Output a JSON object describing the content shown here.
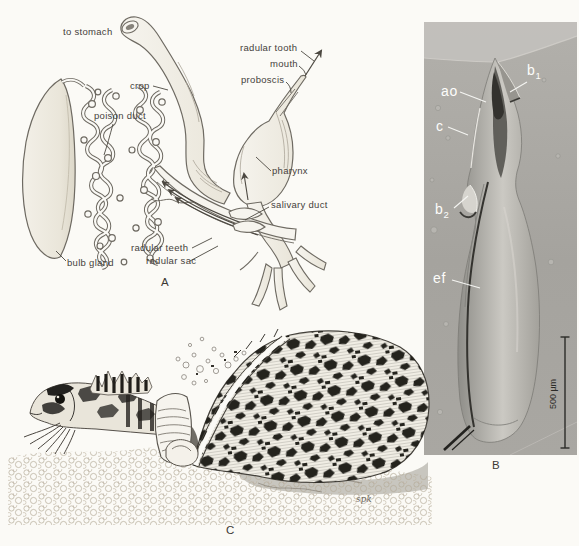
{
  "panel_a": {
    "panel_letter": "A",
    "labels": {
      "to_stomach": "to stomach",
      "crop": "crop",
      "poison_duct": "poison duct",
      "radular_tooth": "radular tooth",
      "mouth": "mouth",
      "proboscis": "proboscis",
      "pharynx": "pharynx",
      "salivary_duct": "salivary duct",
      "radular_teeth": "radular teeth",
      "radular_sac": "radular sac",
      "bulb_gland": "bulb gland"
    }
  },
  "panel_b": {
    "panel_letter": "B",
    "labels": {
      "ao": "ao",
      "b1_base": "b",
      "b1_sub": "1",
      "c": "c",
      "b2_base": "b",
      "b2_sub": "2",
      "ef": "ef"
    },
    "scale_bar_label": "500 µm"
  },
  "panel_c": {
    "panel_letter": "C",
    "signature": "spk"
  },
  "colors": {
    "paper": "#fbfaf6",
    "ink": "#55504a",
    "sem_background": "#a7a5a0",
    "sem_highlight": "#c6c4bf",
    "label_white": "#ffffff"
  }
}
